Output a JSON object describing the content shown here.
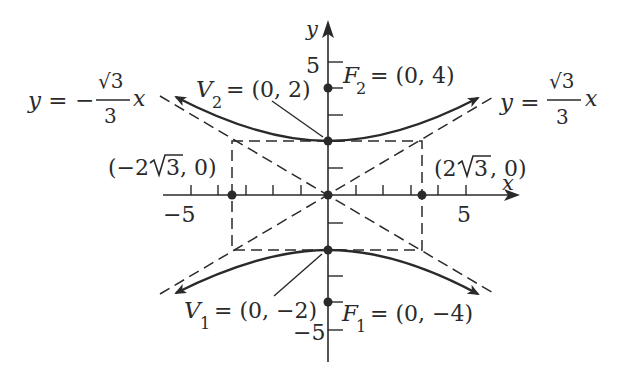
{
  "figure": {
    "type": "hyperbola",
    "equation_form": "vertical transverse axis",
    "axes": {
      "x_label": "x",
      "y_label": "y",
      "x_tick_labels": {
        "neg": "−5",
        "pos": "5"
      },
      "y_tick_labels": {
        "pos": "5",
        "neg": "−5"
      }
    },
    "points": {
      "V2": {
        "name": "V",
        "sub": "2",
        "eq": "= (0, 2)"
      },
      "F2": {
        "name": "F",
        "sub": "2",
        "eq": "= (0, 4)"
      },
      "V1": {
        "name": "V",
        "sub": "1",
        "eq": "= (0, −2)"
      },
      "F1": {
        "name": "F",
        "sub": "1",
        "eq": "= (0, −4)"
      },
      "left": {
        "open": "(−2 ",
        "root": "3",
        "close": ", 0)"
      },
      "right": {
        "open": "(2 ",
        "root": "3",
        "close": ", 0)"
      }
    },
    "asymptotes": {
      "left": {
        "lhs": "y = −",
        "num": "√3",
        "den": "3",
        "var": "x"
      },
      "right": {
        "lhs": "y = ",
        "num": "√3",
        "den": "3",
        "var": "x"
      }
    },
    "colors": {
      "ink": "#2a2a2a",
      "background": "#ffffff"
    }
  }
}
